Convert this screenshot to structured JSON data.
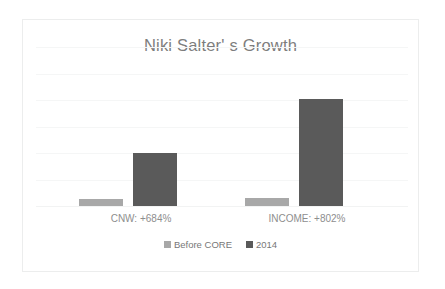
{
  "chart_data": {
    "type": "bar",
    "title": "Niki Salter' s Growth",
    "xlabel": "",
    "ylabel": "",
    "grid": true,
    "legend_position": "bottom",
    "ylim": [
      0,
      6
    ],
    "gridline_count": 6,
    "categories": [
      "CNW: +684%",
      "INCOME: +802%"
    ],
    "series": [
      {
        "name": "Before CORE",
        "color": "#a8a8a8",
        "values": [
          0.27,
          0.3
        ]
      },
      {
        "name": "2014",
        "color": "#5a5a5a",
        "values": [
          2.0,
          4.05
        ]
      }
    ]
  },
  "style": {
    "frame_border_color": "#eceded",
    "gridline_color": "#f5f6f6",
    "title_color": "#7d7d7d",
    "label_color": "#8e8e8e",
    "legend_text_color": "#777777",
    "background": "#ffffff"
  }
}
